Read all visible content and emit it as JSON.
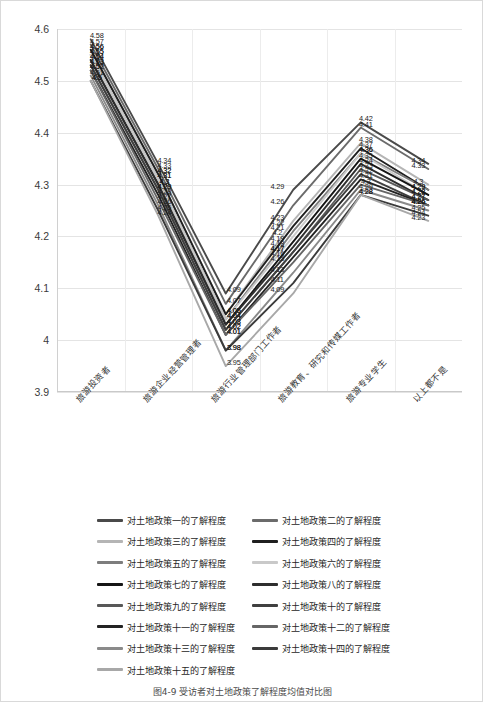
{
  "figure": {
    "caption": "图4-9  受访者对土地政策了解程度均值对比图"
  },
  "chart_data": {
    "type": "line",
    "title": "",
    "xlabel": "",
    "ylabel": "",
    "ylim": [
      3.9,
      4.6
    ],
    "ytick_labels": [
      "4.6",
      "4.5",
      "4.4",
      "4.3",
      "4.2",
      "4.1",
      "4",
      "3.9"
    ],
    "ytick_values": [
      4.6,
      4.5,
      4.4,
      4.3,
      4.2,
      4.1,
      4.0,
      3.9
    ],
    "grid": true,
    "legend_position": "bottom",
    "categories": [
      "旅游投资者",
      "旅游企业经营管理者",
      "旅游行业管理部门工作者",
      "旅游教育、研究和传媒工作者",
      "旅游专业学生",
      "以上都不是"
    ],
    "series": [
      {
        "name": "对土地政策一的了解程度",
        "color": "#4a4a4a",
        "values": [
          4.58,
          4.34,
          4.09,
          4.29,
          4.42,
          4.34
        ]
      },
      {
        "name": "对土地政策二的了解程度",
        "color": "#6b6b6b",
        "values": [
          4.57,
          4.33,
          4.07,
          4.26,
          4.41,
          4.33
        ]
      },
      {
        "name": "对土地政策三的了解程度",
        "color": "#b5b5b5",
        "values": [
          4.56,
          4.32,
          4.05,
          4.23,
          4.38,
          4.3
        ]
      },
      {
        "name": "对土地政策四的了解程度",
        "color": "#1f1f1f",
        "values": [
          4.56,
          4.32,
          4.05,
          4.22,
          4.37,
          4.29
        ]
      },
      {
        "name": "对土地政策五的了解程度",
        "color": "#7d7d7d",
        "values": [
          4.55,
          4.31,
          4.04,
          4.21,
          4.36,
          4.29
        ]
      },
      {
        "name": "对土地政策六的了解程度",
        "color": "#c9c9c9",
        "values": [
          4.55,
          4.31,
          4.04,
          4.2,
          4.36,
          4.28
        ]
      },
      {
        "name": "对土地政策七的了解程度",
        "color": "#151515",
        "values": [
          4.54,
          4.3,
          4.03,
          4.19,
          4.35,
          4.28
        ]
      },
      {
        "name": "对土地政策八的了解程度",
        "color": "#2e2e2e",
        "values": [
          4.54,
          4.3,
          4.03,
          4.18,
          4.34,
          4.27
        ]
      },
      {
        "name": "对土地政策九的了解程度",
        "color": "#585858",
        "values": [
          4.53,
          4.29,
          4.02,
          4.17,
          4.33,
          4.27
        ]
      },
      {
        "name": "对土地政策十的了解程度",
        "color": "#404040",
        "values": [
          4.53,
          4.29,
          4.02,
          4.17,
          4.32,
          4.26
        ]
      },
      {
        "name": "对土地政策十一的了解程度",
        "color": "#232323",
        "values": [
          4.52,
          4.28,
          4.01,
          4.16,
          4.31,
          4.26
        ]
      },
      {
        "name": "对土地政策十二的了解程度",
        "color": "#666666",
        "values": [
          4.52,
          4.27,
          4.01,
          4.15,
          4.3,
          4.26
        ]
      },
      {
        "name": "对土地政策十三的了解程度",
        "color": "#8a8a8a",
        "values": [
          4.51,
          4.26,
          3.98,
          4.13,
          4.29,
          4.25
        ]
      },
      {
        "name": "对土地政策十四的了解程度",
        "color": "#3b3b3b",
        "values": [
          4.5,
          4.25,
          3.98,
          4.11,
          4.28,
          4.24
        ]
      },
      {
        "name": "对土地政策十五的了解程度",
        "color": "#a8a8a8",
        "values": [
          4.5,
          4.24,
          3.95,
          4.09,
          4.28,
          4.23
        ]
      }
    ],
    "point_labels": {
      "0": [
        "4.58",
        "4.57",
        "4.56",
        "4.56",
        "4.55",
        "4.55",
        "4.54",
        "4.54",
        "4.53",
        "4.53",
        "4.52",
        "4.52",
        "4.51",
        "4.5",
        "4.5"
      ],
      "1": [
        "4.34",
        "4.33",
        "4.32",
        "4.32",
        "4.31",
        "4.31",
        "4.3",
        "4.3",
        "4.29",
        "4.29",
        "4.28",
        "4.27",
        "4.26",
        "4.25",
        "4.24"
      ],
      "2": [
        "4.09",
        "4.07",
        "4.05",
        "4.05",
        "4.04",
        "4.04",
        "4.03",
        "4.03",
        "4.02",
        "4.02",
        "4.01",
        "4.01",
        "3.98",
        "3.98",
        "3.95"
      ],
      "3": [
        "4.29",
        "4.26",
        "4.23",
        "4.22",
        "4.21",
        "4.2",
        "4.19",
        "4.18",
        "4.17",
        "4.17",
        "4.16",
        "4.15",
        "4.13",
        "4.11",
        "4.09"
      ],
      "4": [
        "4.42",
        "4.41",
        "4.38",
        "4.37",
        "4.36",
        "4.36",
        "4.35",
        "4.34",
        "4.33",
        "4.32",
        "4.31",
        "4.3",
        "4.29",
        "4.28",
        "4.28"
      ],
      "5": [
        "4.34",
        "4.33",
        "4.3",
        "4.29",
        "4.29",
        "4.28",
        "4.28",
        "4.27",
        "4.27",
        "4.26",
        "4.26",
        "4.26",
        "4.25",
        "4.24",
        "4.23"
      ]
    }
  }
}
